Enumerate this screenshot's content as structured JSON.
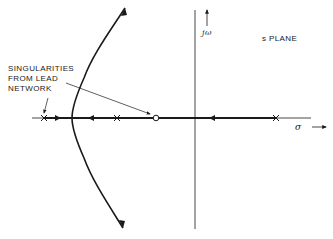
{
  "figure": {
    "type": "root-locus",
    "plane_label": "s PLANE",
    "imag_axis_label": "jω",
    "real_axis_label": "σ",
    "annotation": {
      "lines": [
        "SINGULARITIES",
        "FROM LEAD",
        "NETWORK"
      ],
      "text": "SINGULARITIES\nFROM LEAD\nNETWORK",
      "points_to": [
        "pole at far left",
        "zero"
      ]
    },
    "poles": [
      {
        "name": "lead-network-pole",
        "x": 44
      },
      {
        "name": "plant-pole-left",
        "x": 117
      },
      {
        "name": "plant-pole-right",
        "x": 276
      }
    ],
    "zeros": [
      {
        "name": "lead-network-zero",
        "x": 156
      }
    ],
    "locus_branches": [
      "real-axis segment from lead pole toward breakaway",
      "real-axis segment from left plant pole toward breakaway",
      "real-axis segment from right plant pole to zero",
      "complex branch going to upper asymptote",
      "complex branch going to lower asymptote"
    ],
    "colors": {
      "ink": "#1a1a1a",
      "background": "#ffffff"
    }
  }
}
